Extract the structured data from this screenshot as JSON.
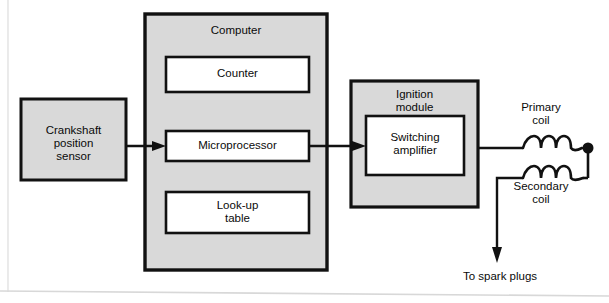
{
  "diagram": {
    "background_color": "#ffffff",
    "box_fill_gray": "#d9d9d9",
    "box_fill_white": "#ffffff",
    "stroke_color": "#111111",
    "blocks": [
      {
        "id": "crankshaft-position-sensor",
        "label": "Crankshaft\nposition\nsensor",
        "fill": "gray",
        "x": 21,
        "y": 99,
        "w": 105,
        "h": 81
      },
      {
        "id": "computer",
        "label": "Computer",
        "fill": "gray",
        "x": 145,
        "y": 14,
        "w": 182,
        "h": 256
      },
      {
        "id": "counter",
        "label": "Counter",
        "fill": "white",
        "x": 166,
        "y": 57,
        "w": 143,
        "h": 35
      },
      {
        "id": "microprocessor",
        "label": "Microprocessor",
        "fill": "white",
        "x": 166,
        "y": 131,
        "w": 143,
        "h": 30
      },
      {
        "id": "look-up-table",
        "label": "Look-up\ntable",
        "fill": "white",
        "x": 166,
        "y": 192,
        "w": 143,
        "h": 41
      },
      {
        "id": "ignition-module",
        "label": "Ignition\nmodule",
        "fill": "gray",
        "x": 351,
        "y": 81,
        "w": 127,
        "h": 126
      },
      {
        "id": "switching-amplifier",
        "label": "Switching\namplifier",
        "fill": "white",
        "x": 366,
        "y": 116,
        "w": 98,
        "h": 59
      }
    ],
    "free_labels": [
      {
        "id": "primary-coil-label",
        "text": "Primary\ncoil",
        "x": 516,
        "y": 103
      },
      {
        "id": "secondary-coil-label",
        "text": "Secondary\ncoil",
        "x": 511,
        "y": 182
      },
      {
        "id": "to-spark-plugs-label",
        "text": "To spark plugs",
        "x": 450,
        "y": 270
      }
    ],
    "connections": [
      {
        "id": "sensor-to-microprocessor",
        "kind": "arrow",
        "from": "crankshaft-position-sensor",
        "to": "microprocessor"
      },
      {
        "id": "microprocessor-to-switching-amplifier",
        "kind": "arrow",
        "from": "microprocessor",
        "to": "switching-amplifier"
      },
      {
        "id": "ignition-module-to-primary-coil",
        "kind": "wire",
        "from": "ignition-module",
        "to": "primary-coil"
      },
      {
        "id": "primary-to-secondary-coil",
        "kind": "wire",
        "from": "primary-coil",
        "to": "secondary-coil"
      },
      {
        "id": "secondary-coil-to-spark-plugs",
        "kind": "arrow",
        "from": "secondary-coil",
        "to": "to-spark-plugs-label"
      }
    ],
    "coils": [
      {
        "id": "primary-coil",
        "loops": 3,
        "x": 522,
        "y": 148
      },
      {
        "id": "secondary-coil",
        "loops": 3,
        "x": 522,
        "y": 178
      }
    ],
    "terminal_dot": {
      "id": "primary-coil-terminal",
      "x": 588,
      "y": 148,
      "r": 5
    }
  }
}
